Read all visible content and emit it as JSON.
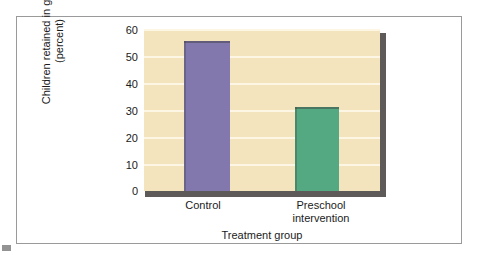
{
  "chart_data": {
    "type": "bar",
    "title": "",
    "xlabel": "Treatment group",
    "ylabel": "Children retained in grade (percent)",
    "ylabel_lines": [
      "Children retained in grade",
      "(percent)"
    ],
    "categories": [
      "Control",
      "Preschool intervention"
    ],
    "category_lines": [
      [
        "Control"
      ],
      [
        "Preschool",
        "intervention"
      ]
    ],
    "values": [
      55.5,
      31.3
    ],
    "ylim": [
      0,
      60
    ],
    "yticks": [
      0,
      10,
      20,
      30,
      40,
      50,
      60
    ],
    "ytick_labels": [
      "0",
      "10",
      "20",
      "30",
      "40",
      "50",
      "60"
    ],
    "grid": true,
    "legend": "none",
    "colors": {
      "bar_control": "#8278ad",
      "bar_preschool": "#54a882",
      "plot_background": "#f3e4bd",
      "gridline": "#fdf6e4",
      "axis_shadow": "#5d5a59",
      "frame_border": "#9a9a9a",
      "text": "#1b1b1b"
    }
  }
}
